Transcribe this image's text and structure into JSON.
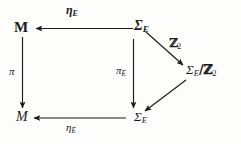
{
  "diagram": {
    "kind": "commutative-diagram",
    "background_color": "#fdfdfc",
    "ink_color": "#1a1a1a",
    "nodes": [
      {
        "id": "m-top",
        "label": "M",
        "subscript": "",
        "style": "bold-upright",
        "position": "top-left"
      },
      {
        "id": "sigma-top",
        "label": "Σ",
        "subscript": "E",
        "style": "bold-italic",
        "position": "top-right"
      },
      {
        "id": "quotient",
        "label": "Σ",
        "subscript": "E",
        "suffix": "/ℤ",
        "suffix_subscript": "2",
        "style": "italic-blackboard",
        "position": "middle-right"
      },
      {
        "id": "m-bottom",
        "label": "M",
        "subscript": "",
        "style": "italic",
        "position": "bottom-left"
      },
      {
        "id": "sigma-bot",
        "label": "Σ",
        "subscript": "E",
        "style": "italic",
        "position": "bottom-right"
      }
    ],
    "arrow_labels": {
      "eta_top": {
        "glyph": "η",
        "subscript": "E",
        "style": "bold-italic"
      },
      "eta_bottom": {
        "glyph": "η",
        "subscript": "E",
        "style": "italic"
      },
      "pi_left": {
        "glyph": "π",
        "subscript": "",
        "style": "italic"
      },
      "pi_middle": {
        "glyph": "π",
        "subscript": "E",
        "style": "italic"
      },
      "z2": {
        "glyph": "ℤ",
        "subscript": "2",
        "style": "blackboard-bold"
      }
    },
    "arrows": [
      {
        "id": "arrow-eta-top",
        "from": "sigma-top",
        "to": "m-top",
        "direction": "left",
        "label": "eta_top"
      },
      {
        "id": "arrow-pi-left",
        "from": "m-top",
        "to": "m-bottom",
        "direction": "down",
        "label": "pi_left"
      },
      {
        "id": "arrow-pi-middle",
        "from": "sigma-top",
        "to": "sigma-bot",
        "direction": "down",
        "label": "pi_middle"
      },
      {
        "id": "arrow-eta-bottom",
        "from": "sigma-bot",
        "to": "m-bottom",
        "direction": "left",
        "label": "eta_bottom"
      },
      {
        "id": "arrow-quotient-map",
        "from": "sigma-top",
        "to": "quotient",
        "direction": "down-right",
        "label": "z2"
      },
      {
        "id": "arrow-section-map",
        "from": "quotient",
        "to": "sigma-bot",
        "direction": "down-left",
        "label": ""
      }
    ]
  }
}
